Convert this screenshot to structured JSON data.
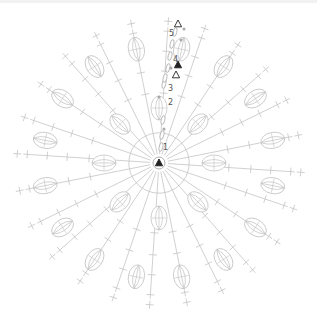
{
  "diagram": {
    "type": "crochet-round-chart",
    "center": {
      "x": 159,
      "y": 163
    },
    "stitch_color": "#c4c4c4",
    "marker_color": "#222222",
    "highlight_dot_color": "#a9a9a9",
    "spokes": 24,
    "inner_puffs": 8,
    "outer_puffs": 16,
    "row_labels": [
      {
        "text": "1",
        "x": 163,
        "y": 150
      },
      {
        "text": "2",
        "x": 168,
        "y": 105
      },
      {
        "text": "3",
        "x": 168,
        "y": 91
      },
      {
        "text": "4",
        "x": 173,
        "y": 62
      },
      {
        "text": "5",
        "x": 169,
        "y": 36
      }
    ],
    "markers": [
      {
        "name": "start-marker",
        "type": "filled-triangle",
        "x": 159,
        "y": 163
      },
      {
        "name": "row4-join-marker",
        "type": "filled-triangle",
        "x": 178,
        "y": 65
      },
      {
        "name": "row4-fasten-marker",
        "type": "open-triangle",
        "x": 176,
        "y": 75
      },
      {
        "name": "row5-fasten-marker",
        "type": "open-triangle",
        "x": 178,
        "y": 24
      }
    ]
  }
}
